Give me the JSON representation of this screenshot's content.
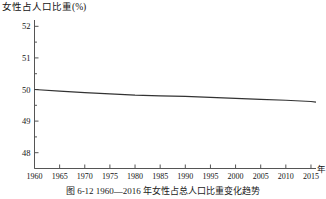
{
  "figure": {
    "axis_title": "女性占人口比重(%)",
    "caption": "图 6-12  1960—2016 年女性占总人口比重变化趋势",
    "x_unit_label": "年"
  },
  "colors": {
    "line": "#333333",
    "axis": "#555555",
    "text": "#141414",
    "background": "#ffffff"
  },
  "chart_data": {
    "type": "line",
    "title": "女性占人口比重(%)",
    "xlabel": "年",
    "ylabel": "女性占人口比重(%)",
    "xlim": [
      1960,
      2016
    ],
    "ylim": [
      47.5,
      52.2
    ],
    "grid": false,
    "legend": null,
    "xticks": [
      1960,
      1965,
      1970,
      1975,
      1980,
      1985,
      1990,
      1995,
      2000,
      2005,
      2010,
      2015
    ],
    "xtick_labels": [
      "1960",
      "1965",
      "1970",
      "1975",
      "1980",
      "1985",
      "1990",
      "1995",
      "2000",
      "2005",
      "2010",
      "2015"
    ],
    "yticks": [
      48,
      49,
      50,
      51,
      52
    ],
    "ytick_labels": [
      "48",
      "49",
      "50",
      "51",
      "52"
    ],
    "y_minor_ticks": [
      47.5,
      48.5,
      49.5,
      50.5,
      51.5
    ],
    "series": [
      {
        "name": "女性占人口比重",
        "x": [
          1960,
          1965,
          1970,
          1975,
          1980,
          1985,
          1990,
          1995,
          2000,
          2005,
          2010,
          2015,
          2016
        ],
        "values": [
          50.0,
          49.95,
          49.9,
          49.86,
          49.82,
          49.8,
          49.78,
          49.75,
          49.72,
          49.69,
          49.66,
          49.62,
          49.6
        ]
      }
    ]
  }
}
